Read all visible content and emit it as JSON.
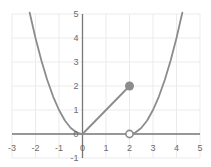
{
  "chart_data": {
    "type": "line",
    "title": "",
    "xlabel": "",
    "ylabel": "",
    "xlim": [
      -3,
      5
    ],
    "ylim": [
      -1,
      5
    ],
    "grid": true,
    "legend": null,
    "xticks": [
      -3,
      -2,
      -1,
      0,
      1,
      2,
      3,
      4,
      5
    ],
    "xtick_labels": [
      "-3",
      "-2",
      "-1",
      "0",
      "1",
      "2",
      "3",
      "4",
      "5"
    ],
    "yticks": [
      -1,
      0,
      1,
      2,
      3,
      4,
      5
    ],
    "ytick_labels": [
      "-1",
      "0",
      "1",
      "2",
      "3",
      "4",
      "5"
    ],
    "curve_color": "#8c8c8c",
    "axis_color": "#777777",
    "grid_color": "#ebebeb",
    "label_color": "#6b6b6b",
    "series": [
      {
        "name": "left-parabola-branch",
        "style": "solid",
        "x": [
          -2.25,
          -2.0,
          -1.75,
          -1.5,
          -1.25,
          -1.0,
          -0.75,
          -0.5,
          -0.25,
          0
        ],
        "y": [
          5.06,
          4.0,
          3.06,
          2.25,
          1.56,
          1.0,
          0.56,
          0.25,
          0.06,
          0
        ]
      },
      {
        "name": "line-segment-origin-to-point",
        "style": "solid",
        "x": [
          0,
          2
        ],
        "y": [
          0,
          2
        ]
      },
      {
        "name": "right-parabola-branch",
        "style": "solid",
        "x": [
          2.0,
          2.25,
          2.5,
          2.75,
          3.0,
          3.25,
          3.5,
          3.75,
          4.0,
          4.25
        ],
        "y": [
          0,
          0.06,
          0.25,
          0.56,
          1.0,
          1.56,
          2.25,
          3.06,
          4.0,
          5.06
        ]
      }
    ],
    "markers": [
      {
        "name": "closed-point",
        "kind": "filled-circle",
        "x": 2,
        "y": 2,
        "color": "#8c8c8c",
        "radius": 4.5
      },
      {
        "name": "open-point",
        "kind": "open-circle",
        "x": 2,
        "y": 0,
        "color": "#8c8c8c",
        "radius": 4.5
      }
    ]
  }
}
